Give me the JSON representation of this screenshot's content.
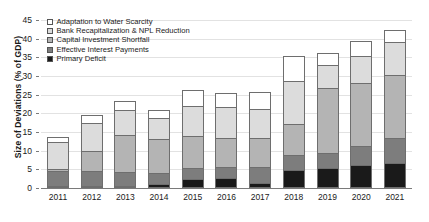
{
  "chart_data": {
    "type": "bar",
    "stacked": true,
    "title": "",
    "xlabel": "",
    "ylabel": "Size of Deviations (% of GDP)",
    "ylim": [
      0,
      45
    ],
    "ytick_step": 5,
    "yticks": [
      0,
      5,
      10,
      15,
      20,
      25,
      30,
      35,
      40,
      45
    ],
    "grid": true,
    "legend_position": "top-left",
    "categories": [
      "2011",
      "2012",
      "2013",
      "2014",
      "2015",
      "2016",
      "2017",
      "2018",
      "2019",
      "2020",
      "2021"
    ],
    "series": [
      {
        "name": "Primary Deficit",
        "color": "#1a1a1a",
        "values": [
          0.3,
          0.6,
          0.6,
          1.2,
          2.4,
          2.7,
          1.4,
          4.8,
          5.4,
          6.2,
          6.7
        ]
      },
      {
        "name": "Effective Interest Payments",
        "color": "#7d7d7d",
        "values": [
          4.0,
          3.9,
          3.7,
          2.7,
          3.0,
          2.8,
          4.2,
          4.0,
          3.9,
          5.1,
          6.7
        ]
      },
      {
        "name": "Capital Investment Shortfall",
        "color": "#b4b4b4",
        "values": [
          0.6,
          5.5,
          9.9,
          9.2,
          8.5,
          7.9,
          7.9,
          8.4,
          17.4,
          16.9,
          16.9
        ]
      },
      {
        "name": "Bank Recapitalization & NPL Reduction",
        "color": "#dcdcdc",
        "values": [
          7.2,
          7.4,
          6.8,
          5.6,
          8.1,
          8.4,
          7.7,
          11.4,
          6.3,
          7.3,
          8.8
        ]
      },
      {
        "name": "Adaptation to Water Scarcity",
        "color": "#ffffff",
        "values": [
          1.3,
          2.2,
          2.3,
          2.3,
          4.2,
          3.6,
          4.6,
          6.7,
          3.1,
          4.0,
          3.3
        ]
      }
    ],
    "totals": [
      13.4,
      19.6,
      23.3,
      21.0,
      26.2,
      25.4,
      25.8,
      35.3,
      36.1,
      39.5,
      42.4
    ]
  },
  "axis": {
    "y_title": "Size of Deviations (% of GDP)"
  },
  "legend": {
    "items": [
      {
        "label": "Adaptation to Water Scarcity",
        "color": "#ffffff"
      },
      {
        "label": "Bank Recapitalization & NPL Reduction",
        "color": "#dcdcdc"
      },
      {
        "label": "Capital Investment Shortfall",
        "color": "#b4b4b4"
      },
      {
        "label": "Effective Interest Payments",
        "color": "#7d7d7d"
      },
      {
        "label": "Primary Deficit",
        "color": "#1a1a1a"
      }
    ]
  }
}
